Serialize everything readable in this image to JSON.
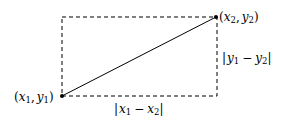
{
  "diagram": {
    "type": "distance-illustration",
    "points": {
      "p1": {
        "label_x": "x",
        "label_y": "y",
        "index": "1",
        "px": [
          62,
          96
        ]
      },
      "p2": {
        "label_x": "x",
        "label_y": "y",
        "index": "2",
        "px": [
          216,
          16
        ]
      }
    },
    "labels": {
      "p1": {
        "open": "(",
        "x": "x",
        "xi": "1",
        "comma": ",",
        "y": "y",
        "yi": "1",
        "close": ")"
      },
      "p2": {
        "open": "(",
        "x": "x",
        "xi": "2",
        "comma": ",",
        "y": "y",
        "yi": "2",
        "close": ")"
      },
      "dx": {
        "bar1": "|",
        "a": "x",
        "ai": "1",
        "minus": "−",
        "b": "x",
        "bi": "2",
        "bar2": "|"
      },
      "dy": {
        "bar1": "|",
        "a": "y",
        "ai": "1",
        "minus": "−",
        "b": "y",
        "bi": "2",
        "bar2": "|"
      }
    },
    "colors": {
      "line": "#000000",
      "dash": "#000000",
      "background": "#ffffff"
    }
  }
}
